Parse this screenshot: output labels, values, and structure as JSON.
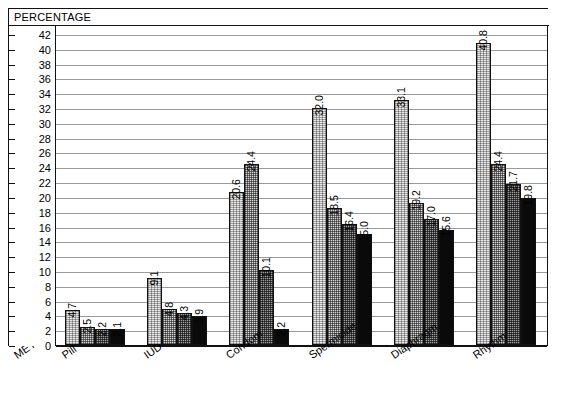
{
  "chart_data": {
    "type": "bar",
    "title": "PERCENTAGE",
    "xlabel": "METHOD",
    "ylabel": "PERCENTAGE",
    "ylim": [
      0,
      42
    ],
    "ytick_step": 2,
    "yticks": [
      42,
      40,
      38,
      36,
      34,
      32,
      30,
      28,
      26,
      24,
      22,
      20,
      18,
      16,
      14,
      12,
      10,
      8,
      6,
      4,
      2,
      0
    ],
    "grid": true,
    "legend": "none",
    "categories": [
      "Pill",
      "IUD",
      "Condom",
      "Spermicide",
      "Diaphragm",
      "Rhythm"
    ],
    "series": [
      {
        "name": "series-1",
        "fill": "light-dither",
        "values": [
          4.7,
          9.1,
          20.6,
          32.0,
          33.1,
          40.8
        ]
      },
      {
        "name": "series-2",
        "fill": "medium-dither",
        "values": [
          2.5,
          4.8,
          24.4,
          18.5,
          19.2,
          24.4
        ]
      },
      {
        "name": "series-3",
        "fill": "dark-dither",
        "values": [
          2.2,
          4.3,
          10.1,
          16.4,
          17.0,
          21.7
        ]
      },
      {
        "name": "series-4",
        "fill": "solid-black",
        "values": [
          2.1,
          3.9,
          2.2,
          15.0,
          15.6,
          19.8
        ]
      }
    ],
    "value_labels": [
      [
        "4.7",
        "2.5",
        "2.2",
        "2.1"
      ],
      [
        "9.1",
        "4.8",
        "4.3",
        "3.9"
      ],
      [
        "20.6",
        "24.4",
        "10.1",
        "2.2"
      ],
      [
        "32.0",
        "18.5",
        "16.4",
        "15.0"
      ],
      [
        "33.1",
        "19.2",
        "17.0",
        "15.6"
      ],
      [
        "40.8",
        "24.4",
        "21.7",
        "19.8"
      ]
    ],
    "colors": {
      "axis": "#111111",
      "grid": "#9a9a9a",
      "series_1": "#e9e9e9",
      "series_2": "#d2d2d2",
      "series_3": "#9c9c9c",
      "series_4": "#0a0a0a",
      "background": "#ffffff"
    }
  }
}
